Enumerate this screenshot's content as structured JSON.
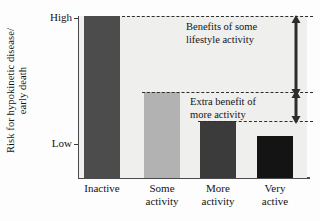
{
  "chart_data": {
    "type": "bar",
    "title": "",
    "xlabel": "",
    "ylabel_line1": "Risk for hypokinetic disease/",
    "ylabel_line2": "early death",
    "categories": [
      "Inactive",
      "Some activity",
      "More activity",
      "Very active"
    ],
    "category_lines": [
      {
        "l1": "Inactive",
        "l2": ""
      },
      {
        "l1": "Some",
        "l2": "activity"
      },
      {
        "l1": "More",
        "l2": "activity"
      },
      {
        "l1": "Very",
        "l2": "active"
      }
    ],
    "values": [
      100,
      53,
      35,
      26
    ],
    "ytick_labels": [
      "High",
      "Low"
    ],
    "ylim_labels": {
      "top": "High",
      "bottom": "Low"
    },
    "grid": false,
    "legend": "none",
    "bar_colors": [
      "#4c4c4c",
      "#b2b2b2",
      "#3b3b3b",
      "#141414"
    ],
    "plot_background": "#efefed",
    "axis_color": "#4a4a4a",
    "annotations": [
      {
        "id": "benefits",
        "line1": "Benefits of some",
        "line2": "lifestyle activity"
      },
      {
        "id": "extra",
        "line1": "Extra benefit of",
        "line2": "more activity"
      }
    ],
    "reference_lines": [
      {
        "id": "top-line",
        "at_category": "Inactive",
        "value": 100
      },
      {
        "id": "mid-line",
        "at_category": "Some activity",
        "value": 53
      },
      {
        "id": "low-line",
        "at_category": "More activity",
        "value": 35
      }
    ]
  },
  "axis": {
    "y_label_line1": "Risk for hypokinetic disease/",
    "y_label_line2": "early death",
    "y_tick_high": "High",
    "y_tick_low": "Low"
  },
  "annotations": {
    "benefits_line1": "Benefits of some",
    "benefits_line2": "lifestyle activity",
    "extra_line1": "Extra benefit of",
    "extra_line2": "more activity"
  },
  "categories": [
    {
      "line1": "Inactive",
      "line2": ""
    },
    {
      "line1": "Some",
      "line2": "activity"
    },
    {
      "line1": "More",
      "line2": "activity"
    },
    {
      "line1": "Very",
      "line2": "active"
    }
  ]
}
